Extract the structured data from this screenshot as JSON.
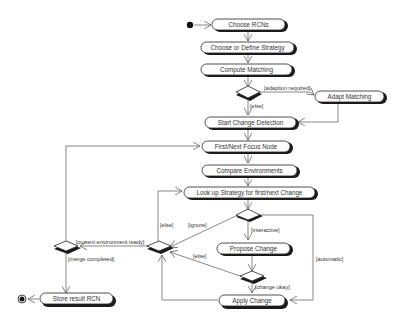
{
  "diagram": {
    "type": "UML activity diagram",
    "nodes": {
      "choose_rcns": "Choose RCNs",
      "choose_strategy": "Choose or Define Strategy",
      "compute_matching": "Compute Matching",
      "adapt_matching": "Adapt Matching",
      "start_change_detection": "Start Change Detection",
      "first_next_focus_node": "First/Next Focus Node",
      "compare_environments": "Compare Environments",
      "look_up_strategy": "Look up Strategy for first/next Change",
      "propose_change": "Propose Change",
      "apply_change": "Apply Change",
      "store_result": "Store result RCN"
    },
    "guards": {
      "adaption_required": "[adaption required]",
      "else_1": "[else]",
      "else_2": "[else]",
      "ignore": "[ignore]",
      "interactive": "[interactive]",
      "automatic": "[automatic]",
      "else_3": "[else]",
      "change_okay": "[change okay]",
      "current_environment_ready": "[current environment ready]",
      "merge_completed": "[merge completed]"
    }
  }
}
